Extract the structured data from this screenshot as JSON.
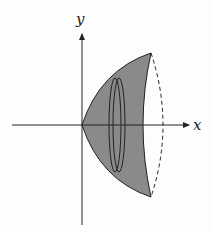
{
  "diagram": {
    "type": "solid-of-revolution",
    "axes": {
      "x_label": "x",
      "y_label": "y"
    },
    "colors": {
      "fill": "#8a8a8a",
      "stroke": "#222222",
      "background": "#fdfdfd"
    },
    "elements": [
      "shaded region",
      "disk slice",
      "dashed back edge"
    ]
  }
}
